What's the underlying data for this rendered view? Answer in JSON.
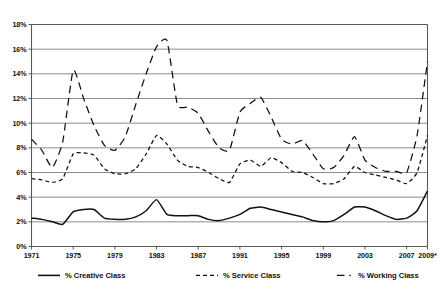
{
  "chart_data": {
    "type": "line",
    "title": "",
    "xlabel": "",
    "ylabel": "",
    "ylim": [
      0,
      18
    ],
    "xlim": [
      1971,
      2009
    ],
    "grid": true,
    "y_ticks": [
      "0%",
      "2%",
      "4%",
      "6%",
      "8%",
      "10%",
      "12%",
      "14%",
      "16%",
      "18%"
    ],
    "y_tick_values": [
      0,
      2,
      4,
      6,
      8,
      10,
      12,
      14,
      16,
      18
    ],
    "x_ticks": [
      "1971",
      "1975",
      "1979",
      "1983",
      "1987",
      "1991",
      "1995",
      "1999",
      "2003",
      "2007",
      "2009*"
    ],
    "x_tick_values": [
      1971,
      1975,
      1979,
      1983,
      1987,
      1991,
      1995,
      1999,
      2003,
      2007,
      2009
    ],
    "legend_position": "bottom",
    "x": [
      1971,
      1972,
      1973,
      1974,
      1975,
      1976,
      1977,
      1978,
      1979,
      1980,
      1981,
      1982,
      1983,
      1984,
      1985,
      1986,
      1987,
      1988,
      1989,
      1990,
      1991,
      1992,
      1993,
      1994,
      1995,
      1996,
      1997,
      1998,
      1999,
      2000,
      2001,
      2002,
      2003,
      2004,
      2005,
      2006,
      2007,
      2008,
      2009
    ],
    "series": [
      {
        "name": "% Creative Class",
        "style": "solid",
        "values": [
          2.3,
          2.2,
          2.0,
          1.8,
          2.8,
          3.0,
          3.0,
          2.3,
          2.2,
          2.2,
          2.4,
          2.9,
          3.8,
          2.6,
          2.5,
          2.5,
          2.5,
          2.2,
          2.1,
          2.3,
          2.6,
          3.1,
          3.2,
          3.0,
          2.8,
          2.6,
          2.4,
          2.1,
          2.0,
          2.1,
          2.6,
          3.2,
          3.2,
          2.9,
          2.5,
          2.2,
          2.3,
          2.9,
          4.5
        ]
      },
      {
        "name": "% Service Class",
        "style": "short-dash",
        "values": [
          5.5,
          5.4,
          5.2,
          5.5,
          7.5,
          7.6,
          7.4,
          6.3,
          5.9,
          5.9,
          6.3,
          7.5,
          9.0,
          8.3,
          7.0,
          6.5,
          6.4,
          6.0,
          5.5,
          5.2,
          6.7,
          7.0,
          6.5,
          7.2,
          6.8,
          6.1,
          6.0,
          5.6,
          5.1,
          5.1,
          5.5,
          6.5,
          6.0,
          5.8,
          5.6,
          5.4,
          5.1,
          6.0,
          9.0
        ]
      },
      {
        "name": "% Working Class",
        "style": "long-dash",
        "values": [
          8.7,
          7.8,
          6.4,
          8.5,
          14.3,
          12.0,
          9.8,
          8.2,
          7.8,
          8.9,
          11.5,
          14.0,
          16.2,
          16.7,
          11.5,
          11.3,
          10.8,
          9.3,
          8.0,
          7.8,
          10.9,
          11.6,
          12.1,
          10.5,
          8.7,
          8.3,
          8.6,
          7.5,
          6.3,
          6.4,
          7.4,
          8.9,
          7.0,
          6.4,
          6.1,
          6.1,
          6.0,
          9.0,
          15.0
        ]
      }
    ]
  },
  "legend": {
    "items": [
      {
        "label": "% Creative Class",
        "style": "solid"
      },
      {
        "label": "% Service Class",
        "style": "short-dash"
      },
      {
        "label": "% Working Class",
        "style": "long-dash"
      }
    ]
  }
}
